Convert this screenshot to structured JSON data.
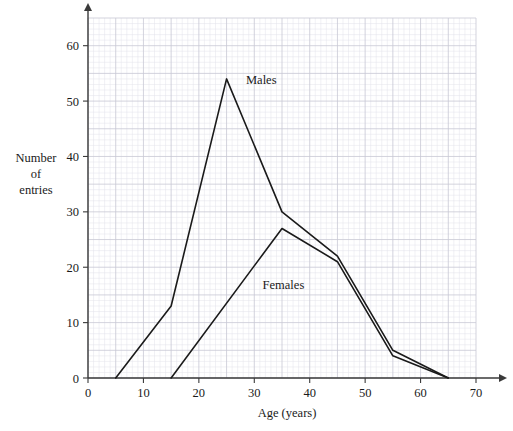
{
  "chart_data": {
    "type": "line",
    "title": "",
    "xlabel": "Age (years)",
    "ylabel": "Number of entries",
    "ylabel_lines": [
      "Number",
      "of",
      "entries"
    ],
    "xlim": [
      0,
      70
    ],
    "ylim": [
      0,
      65
    ],
    "xticks": [
      0,
      10,
      20,
      30,
      40,
      50,
      60,
      70
    ],
    "xtick_labels": [
      "0",
      "10",
      "20",
      "30",
      "40",
      "50",
      "60",
      "70"
    ],
    "yticks": [
      0,
      10,
      20,
      30,
      40,
      50,
      60
    ],
    "ytick_labels": [
      "0",
      "10",
      "20",
      "30",
      "40",
      "50",
      "60"
    ],
    "grid": true,
    "grid_minor_step": 1,
    "grid_major_step": 5,
    "legend": "inline-annotations",
    "series": [
      {
        "name": "Males",
        "label": "Males",
        "color": "#1a1a1a",
        "x": [
          5,
          15,
          25,
          35,
          45,
          55,
          65
        ],
        "y": [
          0,
          13,
          54,
          30,
          22,
          5,
          0
        ]
      },
      {
        "name": "Females",
        "label": "Females",
        "color": "#1a1a1a",
        "x": [
          15,
          35,
          45,
          55,
          65
        ],
        "y": [
          0,
          27,
          21,
          4,
          0
        ]
      }
    ],
    "annotations": [
      {
        "text": "Males",
        "x": 28.5,
        "y": 53
      },
      {
        "text": "Females",
        "x": 31.5,
        "y": 16
      }
    ]
  },
  "colors": {
    "line": "#1a1a1a",
    "axis": "#3a3a3a",
    "grid_minor": "#e2e2ea",
    "grid_major": "#c8c8d4",
    "background": "#ffffff"
  }
}
